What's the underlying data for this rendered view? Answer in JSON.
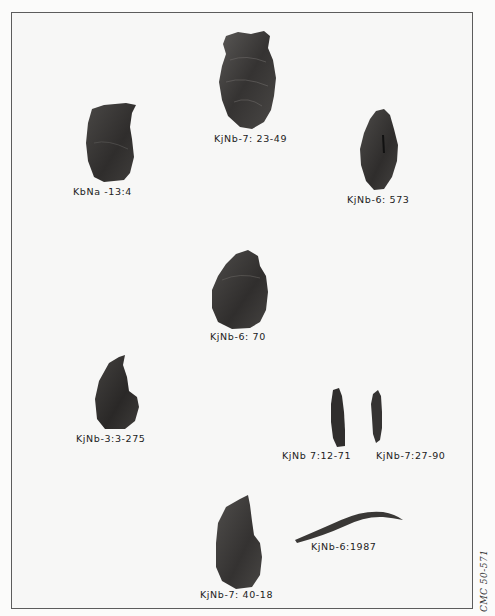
{
  "plate": {
    "border_color": "#5c5c5c",
    "background": "#f7f7f6",
    "artifact_color": "#3a3838"
  },
  "artifacts": [
    {
      "id": "a1",
      "label": "KjNb-7: 23-49"
    },
    {
      "id": "a2",
      "label": "KbNa -13:4"
    },
    {
      "id": "a3",
      "label": "KjNb-6: 573"
    },
    {
      "id": "a4",
      "label": "KjNb-6: 70"
    },
    {
      "id": "a5",
      "label": "KjNb-3:3-275"
    },
    {
      "id": "a6",
      "label": "KjNb 7:12-71"
    },
    {
      "id": "a7",
      "label": "KjNb-7:27-90"
    },
    {
      "id": "a8",
      "label": "KjNb-6:1987"
    },
    {
      "id": "a9",
      "label": "KjNb-7: 40-18"
    }
  ],
  "credit": "CMC 50-571"
}
